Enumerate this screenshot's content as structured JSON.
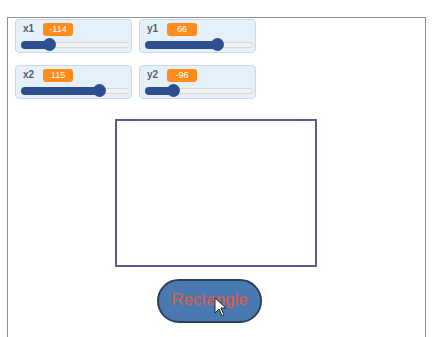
{
  "monitors": [
    {
      "label": "x1",
      "value": "-114",
      "fill_pct": 28
    },
    {
      "label": "y1",
      "value": "66",
      "fill_pct": 68
    },
    {
      "label": "x2",
      "value": "115",
      "fill_pct": 72
    },
    {
      "label": "y2",
      "value": "-96",
      "fill_pct": 27
    }
  ],
  "button": {
    "label": "Rectangle"
  },
  "colors": {
    "monitor_value_bg": "#ff8c1a",
    "slider_fill": "#2e4f8f",
    "rect_border": "#5a5a90",
    "button_bg": "#4a78b0",
    "button_text": "#e05a3a"
  }
}
